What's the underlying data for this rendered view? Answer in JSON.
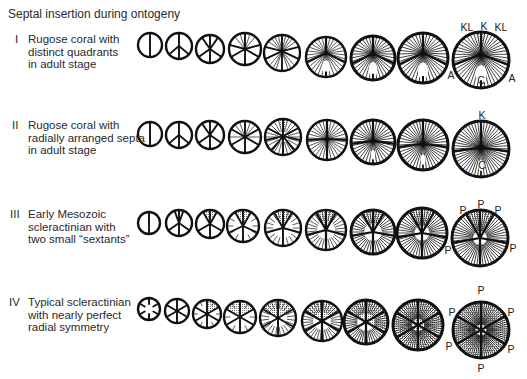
{
  "title": "Septal insertion during ontogeny",
  "colors": {
    "ink": "#111111",
    "stipple": "#7a7a7a",
    "background": "#ffffff"
  },
  "rows": [
    {
      "numeral": "I",
      "numeral_pos": [
        15,
        33
      ],
      "text_pos": [
        28,
        33
      ],
      "lines": [
        "Rugose coral with",
        "distinct quadrants",
        "in adult stage"
      ],
      "labels": [
        {
          "text": "KL",
          "x": 467,
          "y": 31
        },
        {
          "text": "K",
          "x": 484,
          "y": 30
        },
        {
          "text": "KL",
          "x": 501,
          "y": 31
        },
        {
          "text": "A",
          "x": 451,
          "y": 79
        },
        {
          "text": "C",
          "x": 481,
          "y": 84
        },
        {
          "text": "A",
          "x": 512,
          "y": 82
        }
      ],
      "diagrams": [
        {
          "cx": 150,
          "cy": 45,
          "r": 12,
          "major": [
            0,
            180
          ]
        },
        {
          "cx": 179,
          "cy": 46,
          "r": 13,
          "major": [
            0,
            180,
            130,
            230
          ]
        },
        {
          "cx": 210,
          "cy": 49,
          "r": 14,
          "major": [
            0,
            180,
            125,
            235,
            35,
            325
          ]
        },
        {
          "cx": 245,
          "cy": 49,
          "r": 16,
          "major": [
            0,
            180,
            120,
            240,
            75,
            285
          ],
          "thinAngles": [
            18,
            342,
            40,
            320
          ]
        },
        {
          "cx": 282,
          "cy": 53,
          "r": 18,
          "focus": [
            0,
            -0.1
          ],
          "major": [
            0,
            180,
            110,
            250,
            70,
            290
          ],
          "thinAngles": [
            12,
            24,
            36,
            50,
            310,
            324,
            336,
            348,
            135,
            150,
            160,
            200,
            210,
            225
          ]
        },
        {
          "cx": 326,
          "cy": 57,
          "r": 20,
          "focus": [
            0,
            -0.2
          ],
          "major": [
            0,
            105,
            255
          ],
          "thin": {
            "count": 30,
            "len": 1
          },
          "fossula": true,
          "hub": true
        },
        {
          "cx": 373,
          "cy": 58,
          "r": 22,
          "focus": [
            0,
            -0.2
          ],
          "major": [
            0,
            105,
            255
          ],
          "thin": {
            "count": 36,
            "len": 1
          },
          "fossula": true,
          "hub": true
        },
        {
          "cx": 423,
          "cy": 58,
          "r": 25,
          "focus": [
            0,
            -0.2
          ],
          "major": [
            0,
            105,
            255
          ],
          "thin": {
            "count": 40,
            "len": 1
          },
          "fossula": true,
          "hub": true
        },
        {
          "cx": 481,
          "cy": 60,
          "r": 28,
          "focus": [
            0,
            -0.2
          ],
          "major": [
            0,
            100,
            260
          ],
          "thin": {
            "count": 46,
            "len": 1
          },
          "fossula": true,
          "hub": true,
          "shade": [
            [
              350,
              10
            ]
          ]
        }
      ]
    },
    {
      "numeral": "II",
      "numeral_pos": [
        12,
        119
      ],
      "text_pos": [
        28,
        119
      ],
      "lines": [
        "Rugose coral with",
        "radially arranged septa",
        "in adult stage"
      ],
      "labels": [
        {
          "text": "K",
          "x": 482,
          "y": 119
        },
        {
          "text": "C",
          "x": 482,
          "y": 169
        }
      ],
      "diagrams": [
        {
          "cx": 150,
          "cy": 134,
          "r": 12,
          "major": [
            0,
            180
          ]
        },
        {
          "cx": 179,
          "cy": 135,
          "r": 13,
          "major": [
            0,
            180,
            130,
            230
          ]
        },
        {
          "cx": 210,
          "cy": 135,
          "r": 14,
          "major": [
            0,
            180,
            125,
            235,
            35,
            325
          ]
        },
        {
          "cx": 245,
          "cy": 137,
          "r": 16,
          "major": [
            0,
            180,
            120,
            240,
            60,
            300
          ],
          "thinAngles": [
            20,
            340,
            40,
            320,
            90,
            270
          ]
        },
        {
          "cx": 283,
          "cy": 137,
          "r": 18,
          "focus": [
            0,
            -0.05
          ],
          "major": [
            0,
            180,
            100,
            260,
            60,
            300,
            140,
            220
          ],
          "thin": {
            "count": 24,
            "len": 0.7
          },
          "shade": [
            [
              345,
              15
            ]
          ]
        },
        {
          "cx": 327,
          "cy": 140,
          "r": 20,
          "focus": [
            0,
            -0.05
          ],
          "major": [
            0,
            90,
            270,
            180
          ],
          "thin": {
            "count": 30,
            "len": 1
          },
          "hub": true
        },
        {
          "cx": 373,
          "cy": 142,
          "r": 22,
          "focus": [
            0,
            -0.05
          ],
          "major": [
            0,
            95,
            265
          ],
          "thin": {
            "count": 36,
            "len": 1
          },
          "hub": true,
          "fossula_small": true
        },
        {
          "cx": 423,
          "cy": 145,
          "r": 25,
          "focus": [
            0,
            -0.05
          ],
          "major": [
            0,
            95,
            265
          ],
          "thin": {
            "count": 44,
            "len": 1
          },
          "hub": true,
          "fossula_small": true
        },
        {
          "cx": 481,
          "cy": 149,
          "r": 28,
          "focus": [
            0,
            -0.05
          ],
          "major": [
            0,
            95,
            265
          ],
          "thin": {
            "count": 52,
            "len": 1
          },
          "hub": true,
          "fossula_small": true
        }
      ]
    },
    {
      "numeral": "III",
      "numeral_pos": [
        10,
        208
      ],
      "text_pos": [
        28,
        208
      ],
      "lines": [
        "Early Mesozoic",
        "scleractinian with",
        "two small “sextants”"
      ],
      "labels": [
        {
          "text": "P",
          "x": 463,
          "y": 214
        },
        {
          "text": "P",
          "x": 481,
          "y": 208
        },
        {
          "text": "P",
          "x": 498,
          "y": 214
        },
        {
          "text": "P",
          "x": 448,
          "y": 254
        },
        {
          "text": "P",
          "x": 513,
          "y": 252
        }
      ],
      "diagrams": [
        {
          "cx": 149,
          "cy": 223,
          "r": 11,
          "major": [
            0,
            180
          ]
        },
        {
          "cx": 179,
          "cy": 223,
          "r": 13,
          "major": [
            0,
            180,
            125,
            235,
            340,
            20
          ]
        },
        {
          "cx": 210,
          "cy": 224,
          "r": 14,
          "major": [
            0,
            180,
            120,
            240,
            330,
            30
          ],
          "shade": [
            [
              330,
              30
            ]
          ]
        },
        {
          "cx": 243,
          "cy": 226,
          "r": 16,
          "major": [
            0,
            180,
            115,
            245,
            330,
            30
          ],
          "thin": {
            "count": 12,
            "len": 0.4
          },
          "shade": [
            [
              330,
              30
            ]
          ]
        },
        {
          "cx": 283,
          "cy": 228,
          "r": 18,
          "major": [
            0,
            180,
            105,
            255,
            330,
            30
          ],
          "thin": {
            "count": 20,
            "len": 0.45
          },
          "shade": [
            [
              330,
              30
            ]
          ]
        },
        {
          "cx": 326,
          "cy": 230,
          "r": 20,
          "major": [
            0,
            180,
            105,
            255,
            330,
            30
          ],
          "thin": {
            "count": 30,
            "len": 0.55
          },
          "shade": [
            [
              330,
              30
            ]
          ]
        },
        {
          "cx": 373,
          "cy": 232,
          "r": 22,
          "major": [
            0,
            180,
            100,
            260,
            330,
            30
          ],
          "thin": {
            "count": 40,
            "len": 0.6
          },
          "shade": [
            [
              330,
              30
            ]
          ]
        },
        {
          "cx": 422,
          "cy": 233,
          "r": 25,
          "major": [
            0,
            180,
            100,
            260,
            330,
            30
          ],
          "thin": {
            "count": 48,
            "len": 0.7
          },
          "shade": [
            [
              330,
              30
            ]
          ]
        },
        {
          "cx": 480,
          "cy": 238,
          "r": 28,
          "major": [
            0,
            180,
            100,
            260,
            330,
            30
          ],
          "thin": {
            "count": 56,
            "len": 0.75
          },
          "shade": [
            [
              330,
              30
            ]
          ]
        }
      ]
    },
    {
      "numeral": "IV",
      "numeral_pos": [
        9,
        296
      ],
      "text_pos": [
        28,
        296
      ],
      "lines": [
        "Typical scleractinian",
        "with nearly perfect",
        "radial symmetry"
      ],
      "labels": [
        {
          "text": "P",
          "x": 481,
          "y": 294
        },
        {
          "text": "P",
          "x": 452,
          "y": 316
        },
        {
          "text": "P",
          "x": 511,
          "y": 316
        },
        {
          "text": "P",
          "x": 449,
          "y": 350
        },
        {
          "text": "P",
          "x": 511,
          "y": 353
        },
        {
          "text": "P",
          "x": 481,
          "y": 372
        }
      ],
      "diagrams": [
        {
          "cx": 149,
          "cy": 309,
          "r": 11,
          "major": [
            0,
            60,
            120,
            180,
            240,
            300
          ],
          "majorLen": 0.55
        },
        {
          "cx": 177,
          "cy": 311,
          "r": 12,
          "major": [
            0,
            60,
            120,
            180,
            240,
            300
          ]
        },
        {
          "cx": 207,
          "cy": 314,
          "r": 14,
          "major": [
            0,
            60,
            120,
            180,
            240,
            300
          ],
          "thin": {
            "count": 12,
            "len": 0.35,
            "offset": 30
          },
          "shade": [
            [
              0,
              60
            ]
          ]
        },
        {
          "cx": 240,
          "cy": 317,
          "r": 16,
          "major": [
            0,
            60,
            120,
            180,
            240,
            300
          ],
          "thin": {
            "count": 12,
            "len": 0.4,
            "offset": 30
          },
          "shade": [
            [
              300,
              60
            ]
          ]
        },
        {
          "cx": 278,
          "cy": 318,
          "r": 18,
          "major": [
            0,
            60,
            120,
            180,
            240,
            300
          ],
          "thin": {
            "count": 24,
            "len": 0.5,
            "offset": 7.5
          },
          "shade": [
            [
              300,
              60
            ]
          ]
        },
        {
          "cx": 322,
          "cy": 321,
          "r": 20,
          "major": [
            0,
            60,
            120,
            180,
            240,
            300
          ],
          "thin": {
            "count": 36,
            "len": 0.55,
            "offset": 5
          },
          "shade": [
            [
              300,
              60
            ]
          ]
        },
        {
          "cx": 366,
          "cy": 322,
          "r": 22,
          "major": [
            0,
            60,
            120,
            180,
            240,
            300
          ],
          "thin": {
            "count": 48,
            "len": 0.6,
            "offset": 3.75
          },
          "shade": [
            [
              300,
              60
            ],
            [
              60,
              120
            ]
          ]
        },
        {
          "cx": 418,
          "cy": 325,
          "r": 25,
          "major": [
            0,
            60,
            120,
            180,
            240,
            300
          ],
          "thin": {
            "count": 60,
            "len": 0.75,
            "offset": 3
          },
          "shade": [
            [
              0,
              360
            ]
          ]
        },
        {
          "cx": 481,
          "cy": 330,
          "r": 28,
          "major": [
            0,
            60,
            120,
            180,
            240,
            300
          ],
          "thin": {
            "count": 72,
            "len": 0.8,
            "offset": 2.5
          },
          "shade": [
            [
              0,
              360
            ]
          ]
        }
      ]
    }
  ]
}
